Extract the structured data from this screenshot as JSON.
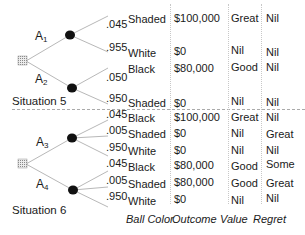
{
  "situations": [
    {
      "label": "Situation 5",
      "alternatives": [
        {
          "label": "A",
          "sub": "1",
          "outcomes": [
            {
              "prob": ".045",
              "color": "Shaded",
              "outcome": "$100,000",
              "value": "Great",
              "regret": "Nil"
            },
            {
              "prob": ".955",
              "color": "White",
              "outcome": "$0",
              "value": "Nil",
              "regret": "Nil"
            }
          ]
        },
        {
          "label": "A",
          "sub": "2",
          "outcomes": [
            {
              "prob": ".050",
              "color": "Black",
              "outcome": "$80,000",
              "value": "Good",
              "regret": "Nil"
            },
            {
              "prob": ".950",
              "color": "Shaded",
              "outcome": "$0",
              "value": "Nil",
              "regret": "Nil"
            }
          ]
        }
      ]
    },
    {
      "label": "Situation 6",
      "alternatives": [
        {
          "label": "A",
          "sub": "3",
          "outcomes": [
            {
              "prob": ".045",
              "color": "Black",
              "outcome": "$100,000",
              "value": "Great",
              "regret": "Nil"
            },
            {
              "prob": ".005",
              "color": "Shaded",
              "outcome": "$0",
              "value": "Nil",
              "regret": "Great"
            },
            {
              "prob": ".950",
              "color": "White",
              "outcome": "$0",
              "value": "Nil",
              "regret": "Nil"
            }
          ]
        },
        {
          "label": "A",
          "sub": "4",
          "outcomes": [
            {
              "prob": ".045",
              "color": "Black",
              "outcome": "$80,000",
              "value": "Good",
              "regret": "Some"
            },
            {
              "prob": ".005",
              "color": "Shaded",
              "outcome": "$80,000",
              "value": "Good",
              "regret": "Great"
            },
            {
              "prob": ".950",
              "color": "White",
              "outcome": "$0",
              "value": "Nil",
              "regret": "Nil"
            }
          ]
        }
      ]
    }
  ],
  "headers": {
    "ball_color": "Ball Color",
    "outcome": "Outcome",
    "value": "Value",
    "regret": "Regret"
  }
}
